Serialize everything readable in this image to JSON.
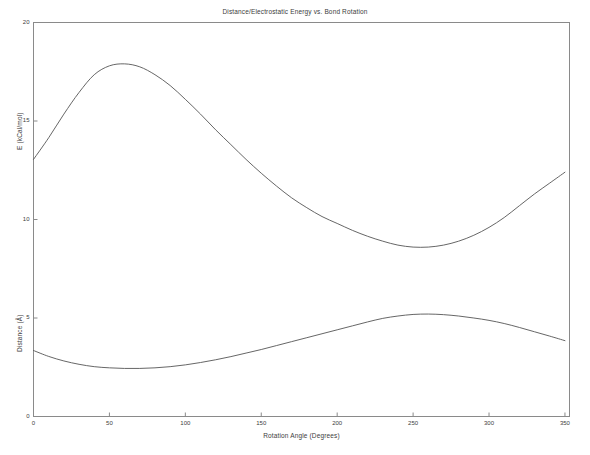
{
  "chart_data": {
    "type": "line",
    "title": "Distance/Electrostatic Energy vs. Bond Rotation",
    "xlabel": "Rotation Angle (Degrees)",
    "ylabel": "",
    "ylabel_upper": "E (kCal/mol)",
    "ylabel_lower": "Distance (Å)",
    "xlim": [
      0,
      353
    ],
    "ylim": [
      0,
      20
    ],
    "grid": false,
    "legend": null,
    "xticks": [
      0,
      50,
      100,
      150,
      200,
      250,
      300,
      350
    ],
    "xtick_labels": [
      "0",
      "50",
      "100",
      "150",
      "200",
      "250",
      "300",
      "350"
    ],
    "yticks": [
      0,
      5,
      10,
      15,
      20
    ],
    "ytick_labels": [
      "0",
      "5",
      "10",
      "15",
      "20"
    ],
    "x": [
      0,
      10,
      20,
      30,
      40,
      50,
      60,
      70,
      80,
      90,
      100,
      110,
      120,
      130,
      140,
      150,
      160,
      170,
      180,
      190,
      200,
      210,
      220,
      230,
      240,
      250,
      260,
      270,
      280,
      290,
      300,
      310,
      320,
      330,
      340,
      350
    ],
    "series": [
      {
        "name": "E (kCal/mol)",
        "axis": "energy",
        "color": "#555555",
        "values": [
          13.05,
          14.15,
          15.35,
          16.45,
          17.35,
          17.8,
          17.9,
          17.75,
          17.35,
          16.8,
          16.1,
          15.35,
          14.55,
          13.8,
          13.05,
          12.35,
          11.7,
          11.1,
          10.6,
          10.15,
          9.8,
          9.45,
          9.15,
          8.9,
          8.7,
          8.6,
          8.6,
          8.7,
          8.9,
          9.2,
          9.6,
          10.1,
          10.7,
          11.3,
          11.85,
          12.4
        ]
      },
      {
        "name": "Distance (Å)",
        "axis": "distance",
        "color": "#555555",
        "values": [
          3.35,
          3.05,
          2.82,
          2.65,
          2.53,
          2.47,
          2.44,
          2.44,
          2.47,
          2.53,
          2.62,
          2.74,
          2.88,
          3.04,
          3.22,
          3.4,
          3.6,
          3.8,
          4.0,
          4.2,
          4.4,
          4.6,
          4.8,
          4.98,
          5.1,
          5.18,
          5.2,
          5.17,
          5.1,
          5.0,
          4.88,
          4.72,
          4.52,
          4.3,
          4.08,
          3.85
        ]
      }
    ],
    "annotations": {
      "energy_peak": {
        "x": 58,
        "y": 17.9
      },
      "energy_min": {
        "x": 253,
        "y": 8.6
      },
      "distance_min": {
        "x": 63,
        "y": 2.44
      },
      "distance_max": {
        "x": 260,
        "y": 5.2
      }
    },
    "colors": {
      "axis": "#8a8a8a",
      "curve": "#555555",
      "text": "#3c3c3c",
      "background": "#ffffff"
    }
  }
}
